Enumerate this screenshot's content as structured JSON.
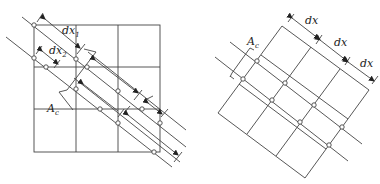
{
  "figure": {
    "left_panel": {
      "description": "Axis-aligned 3x3 grid with oblique parallel rays sampling the grid; ray spacings vary",
      "labels": {
        "dx1": {
          "base": "dx",
          "sub": "1"
        },
        "dx2": {
          "base": "dx",
          "sub": "2"
        },
        "area": {
          "base": "A",
          "sub": "c"
        }
      }
    },
    "right_panel": {
      "description": "Rotated 3x3 grid aligned with rays; uniform spacing dx",
      "labels": {
        "dx_1": "dx",
        "dx_2": "dx",
        "dx_3": "dx",
        "area": {
          "base": "A",
          "sub": "c"
        }
      }
    },
    "colors": {
      "line": "#444444",
      "text": "#222222",
      "background": "#ffffff"
    }
  }
}
